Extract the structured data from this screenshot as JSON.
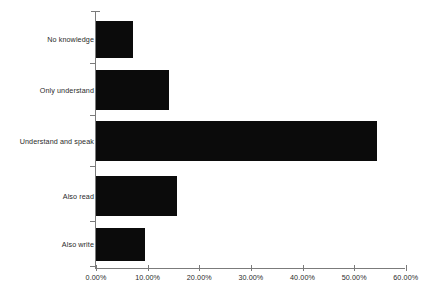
{
  "chart_data": {
    "type": "bar",
    "orientation": "horizontal",
    "title": "",
    "subtitle": "",
    "xlabel": "",
    "ylabel": "",
    "grid": false,
    "legend": false,
    "legend_position": "none",
    "bar_color": "#0b0b0b",
    "axis_color": "#7b7b7b",
    "text_color": "#2a2a2a",
    "background_color": "#ffffff",
    "xlim": [
      0,
      60
    ],
    "xtick_values": [
      0,
      10,
      20,
      30,
      40,
      50,
      60
    ],
    "xtick_labels": [
      "0.00%",
      "10.00%",
      "20.00%",
      "30.00%",
      "40.00%",
      "50.00%",
      "60.00%"
    ],
    "value_format": "percent",
    "categories": [
      "No knowledge",
      "Only understand",
      "Understand and speak",
      "Also read",
      "Also write"
    ],
    "values": [
      7.1,
      14.1,
      54.4,
      15.6,
      9.4
    ],
    "points": [
      {
        "category": "No knowledge",
        "value": 7.1
      },
      {
        "category": "Only understand",
        "value": 14.1
      },
      {
        "category": "Understand and speak",
        "value": 54.4
      },
      {
        "category": "Also read",
        "value": 15.6
      },
      {
        "category": "Also write",
        "value": 9.4
      }
    ]
  },
  "geometry": {
    "origin_x": 96,
    "px_per_unit": 5.163,
    "baseline_y": 268,
    "axis_top_y": 11,
    "bars": [
      {
        "top": 21,
        "height": 37
      },
      {
        "top": 70,
        "height": 40
      },
      {
        "top": 121,
        "height": 40
      },
      {
        "top": 176,
        "height": 40
      },
      {
        "top": 228,
        "height": 33
      }
    ]
  }
}
